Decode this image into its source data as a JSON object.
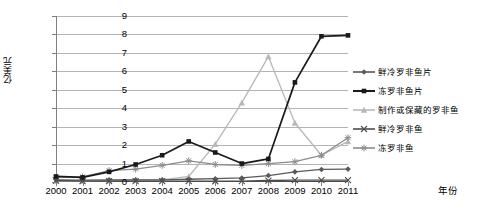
{
  "chart_data": {
    "type": "line",
    "title": "",
    "xlabel": "年份",
    "ylabel": "亿美元",
    "categories": [
      "2000",
      "2001",
      "2002",
      "2003",
      "2004",
      "2005",
      "2006",
      "2007",
      "2008",
      "2009",
      "2010",
      "2011"
    ],
    "x": [
      2000,
      2001,
      2002,
      2003,
      2004,
      2005,
      2006,
      2007,
      2008,
      2009,
      2010,
      2011
    ],
    "ylim": [
      0,
      9
    ],
    "xlim": [
      2000,
      2011
    ],
    "yticks": [
      "0",
      "1",
      "2",
      "3",
      "4",
      "5",
      "6",
      "7",
      "8",
      "9"
    ],
    "grid": true,
    "legend_position": "right",
    "series": [
      {
        "name": "鲜冷罗非鱼片",
        "marker": "diamond",
        "color": "#595959",
        "values": [
          0.12,
          0.1,
          0.12,
          0.12,
          0.12,
          0.15,
          0.18,
          0.22,
          0.35,
          0.55,
          0.68,
          0.7
        ]
      },
      {
        "name": "冻罗非鱼片",
        "marker": "square",
        "color": "#1a1a1a",
        "values": [
          0.3,
          0.25,
          0.55,
          0.95,
          1.45,
          2.2,
          1.6,
          1.0,
          1.25,
          5.4,
          7.9,
          7.95
        ]
      },
      {
        "name": "制作或保藏的罗非鱼",
        "marker": "triangle",
        "color": "#b8b8b8",
        "values": [
          0.05,
          0.05,
          0.08,
          0.1,
          0.12,
          0.3,
          2.05,
          4.3,
          6.8,
          3.2,
          1.45,
          2.2
        ]
      },
      {
        "name": "鲜冷罗非鱼",
        "marker": "x",
        "color": "#4d4d4d",
        "values": [
          0.08,
          0.05,
          0.05,
          0.05,
          0.05,
          0.05,
          0.04,
          0.05,
          0.08,
          0.1,
          0.1,
          0.1
        ]
      },
      {
        "name": "冻罗非鱼",
        "marker": "asterisk",
        "color": "#8c8c8c",
        "values": [
          0.25,
          0.28,
          0.62,
          0.7,
          0.9,
          1.15,
          0.95,
          0.9,
          1.0,
          1.1,
          1.45,
          2.4
        ]
      }
    ]
  },
  "axis": {
    "y_title": "亿美元",
    "x_title": "年份",
    "y_ticks": [
      "9",
      "8",
      "7",
      "6",
      "5",
      "4",
      "3",
      "2",
      "1",
      "0"
    ],
    "x_ticks": [
      "2000",
      "2001",
      "2002",
      "2003",
      "2004",
      "2005",
      "2006",
      "2007",
      "2008",
      "2009",
      "2010",
      "2011"
    ]
  },
  "legend": {
    "items": [
      {
        "label": "鲜冷罗非鱼片"
      },
      {
        "label": "冻罗非鱼片"
      },
      {
        "label": "制作或保藏的罗非鱼"
      },
      {
        "label": "鲜冷罗非鱼"
      },
      {
        "label": "冻罗非鱼"
      }
    ]
  }
}
